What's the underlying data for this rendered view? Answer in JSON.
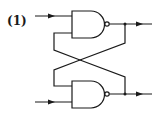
{
  "diagram": {
    "type": "sr-latch-nand",
    "label": "(1)",
    "gates": [
      {
        "id": "top-nand",
        "type": "NAND"
      },
      {
        "id": "bottom-nand",
        "type": "NAND"
      }
    ],
    "stroke_color": "#1a1a1a",
    "background": "#ffffff"
  }
}
